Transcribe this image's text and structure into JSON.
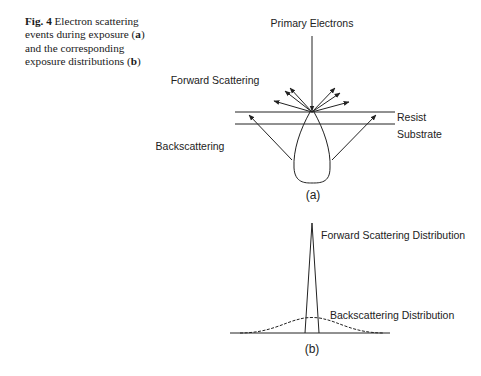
{
  "caption": {
    "fig_label": "Fig. 4",
    "text_part1": " Electron scattering events during exposure (",
    "a_bold": "a",
    "text_part2": ") and the corresponding exposure distributions (",
    "b_bold": "b",
    "text_part3": ")"
  },
  "diagram_a": {
    "primary_label": "Primary Electrons",
    "forward_label": "Forward Scattering",
    "back_label": "Backscattering",
    "resist_label": "Resist",
    "substrate_label": "Substrate",
    "panel_label": "(a)"
  },
  "diagram_b": {
    "forward_dist_label": "Forward Scattering Distribution",
    "back_dist_label": "Backscattering Distribution",
    "panel_label": "(b)"
  }
}
